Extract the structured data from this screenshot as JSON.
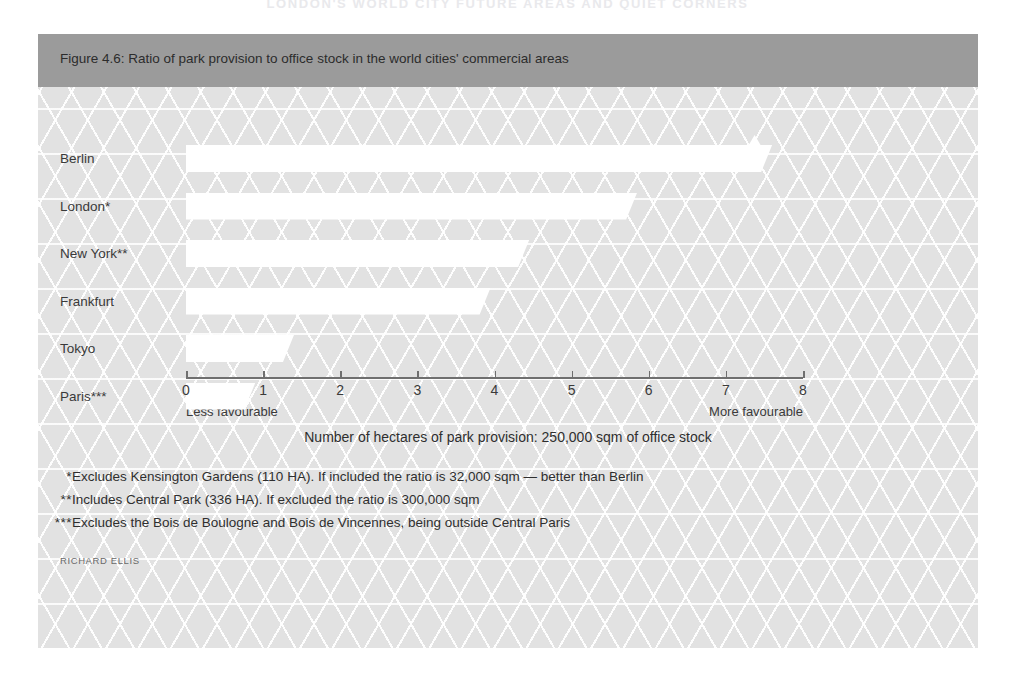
{
  "running_head": "LONDON'S WORLD CITY  FUTURE AREAS AND QUIET CORNERS",
  "figure": {
    "title": "Figure 4.6: Ratio of park provision to office stock in the world cities' commercial areas",
    "source": "RICHARD ELLIS",
    "title_bar_color": "#9b9b9b",
    "panel_color": "#e2e2e2",
    "bar_color": "#ffffff"
  },
  "chart_data": {
    "type": "bar",
    "orientation": "horizontal",
    "title": "Figure 4.6: Ratio of park provision to office stock in the world cities' commercial areas",
    "xlabel": "Number of hectares of park provision: 250,000 sqm of office stock",
    "ylabel": "",
    "xlim": [
      0,
      8
    ],
    "xticks": [
      0,
      1,
      2,
      3,
      4,
      5,
      6,
      7,
      8
    ],
    "xtick_labels": [
      "0",
      "1",
      "2",
      "3",
      "4",
      "5",
      "6",
      "7",
      "8"
    ],
    "grid": false,
    "legend": "none",
    "axis_min_note": "Less favourable",
    "axis_max_note": "More favourable",
    "categories": [
      "Berlin",
      "London*",
      "New York**",
      "Frankfurt",
      "Tokyo",
      "Paris***"
    ],
    "values": [
      7.6,
      5.85,
      4.45,
      3.95,
      1.4,
      0.9
    ]
  },
  "footnotes": [
    {
      "mark": "*",
      "text": "Excludes Kensington Gardens (110 HA). If included the ratio is 32,000 sqm — better than Berlin"
    },
    {
      "mark": "**",
      "text": "Includes Central Park (336 HA). If excluded the ratio is 300,000 sqm"
    },
    {
      "mark": "***",
      "text": "Excludes the Bois de Boulogne and Bois de Vincennes, being outside Central Paris"
    }
  ]
}
